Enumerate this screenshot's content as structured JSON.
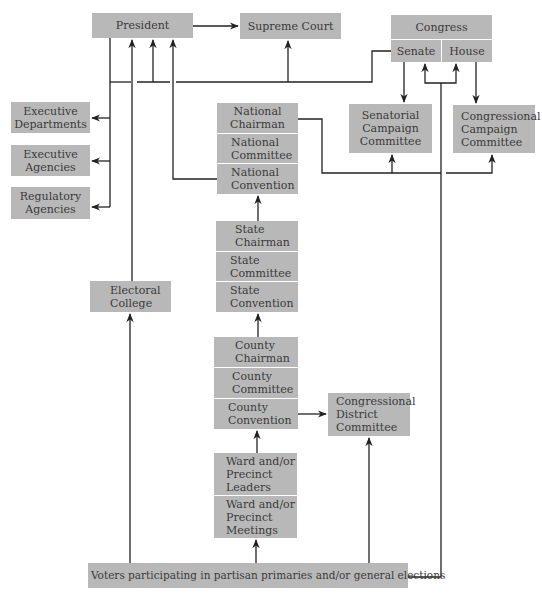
{
  "diagram": {
    "type": "organizational-flow",
    "nodes": {
      "president": {
        "lines": [
          "President"
        ]
      },
      "supreme_court": {
        "lines": [
          "Supreme Court"
        ]
      },
      "congress": {
        "lines": [
          "Congress"
        ]
      },
      "senate": {
        "lines": [
          "Senate"
        ]
      },
      "house": {
        "lines": [
          "House"
        ]
      },
      "executive_departments": {
        "lines": [
          "Executive",
          "Departments"
        ]
      },
      "executive_agencies": {
        "lines": [
          "Executive",
          "Agencies"
        ]
      },
      "regulatory_agencies": {
        "lines": [
          "Regulatory",
          "Agencies"
        ]
      },
      "national_chairman": {
        "lines": [
          "National",
          "Chairman"
        ]
      },
      "national_committee": {
        "lines": [
          "National",
          "Committee"
        ]
      },
      "national_convention": {
        "lines": [
          "National",
          "Convention"
        ]
      },
      "senatorial_campaign_committee": {
        "lines": [
          "Senatorial",
          "Campaign",
          "Committee"
        ]
      },
      "congressional_campaign_committee": {
        "lines": [
          "Congressional",
          "Campaign",
          "Committee"
        ]
      },
      "state_chairman": {
        "lines": [
          "State",
          "Chairman"
        ]
      },
      "state_committee": {
        "lines": [
          "State",
          "Committee"
        ]
      },
      "state_convention": {
        "lines": [
          "State",
          "Convention"
        ]
      },
      "electoral_college": {
        "lines": [
          "Electoral",
          "College"
        ]
      },
      "county_chairman": {
        "lines": [
          "County",
          "Chairman"
        ]
      },
      "county_committee": {
        "lines": [
          "County",
          "Committee"
        ]
      },
      "county_convention": {
        "lines": [
          "County",
          "Convention"
        ]
      },
      "congressional_district_committee": {
        "lines": [
          "Congressional",
          "District",
          "Committee"
        ]
      },
      "ward_leaders": {
        "lines": [
          "Ward and/or",
          "Precinct",
          "Leaders"
        ]
      },
      "ward_meetings": {
        "lines": [
          "Ward and/or",
          "Precinct",
          "Meetings"
        ]
      },
      "voters": {
        "lines": [
          "Voters participating in partisan primaries and/or general elections"
        ]
      }
    },
    "edges": [
      {
        "from": "President",
        "to": "Supreme Court"
      },
      {
        "from": "President",
        "to": "Executive Departments"
      },
      {
        "from": "President",
        "to": "Executive Agencies"
      },
      {
        "from": "President",
        "to": "Regulatory Agencies"
      },
      {
        "from": "Senate",
        "to": "President"
      },
      {
        "from": "Senate",
        "to": "Supreme Court"
      },
      {
        "from": "Senate",
        "to": "Senatorial Campaign Committee"
      },
      {
        "from": "House",
        "to": "Congressional Campaign Committee"
      },
      {
        "from": "National Chairman",
        "to": "Senatorial Campaign Committee"
      },
      {
        "from": "National Chairman",
        "to": "Congressional Campaign Committee"
      },
      {
        "from": "National Convention",
        "to": "President"
      },
      {
        "from": "Electoral College",
        "to": "President"
      },
      {
        "from": "State Chairman",
        "to": "National Convention"
      },
      {
        "from": "County Chairman",
        "to": "State Convention"
      },
      {
        "from": "County Convention",
        "to": "Congressional District Committee"
      },
      {
        "from": "Ward and/or Precinct Leaders",
        "to": "County Convention"
      },
      {
        "from": "Voters",
        "to": "Ward and/or Precinct Meetings"
      },
      {
        "from": "Voters",
        "to": "Electoral College"
      },
      {
        "from": "Voters",
        "to": "Congressional District Committee"
      },
      {
        "from": "Voters",
        "to": "Senate"
      },
      {
        "from": "Voters",
        "to": "House"
      }
    ]
  },
  "colors": {
    "box_fill": "#b8b8b8",
    "text": "#3a3a3a",
    "line": "#222222",
    "background": "#ffffff"
  }
}
